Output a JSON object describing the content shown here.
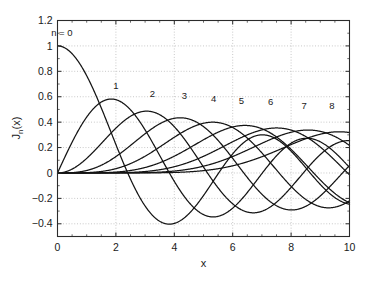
{
  "chart_data": {
    "type": "line",
    "title": "",
    "xlabel": "x",
    "ylabel": "J_n(x)",
    "ylabel_base": "J",
    "ylabel_subscript": "n",
    "ylabel_arg": "(x)",
    "xlim": [
      0,
      10
    ],
    "ylim": [
      -0.5,
      1.2
    ],
    "xticks": [
      0,
      2,
      4,
      6,
      8,
      10
    ],
    "xticklabels": [
      "0",
      "2",
      "4",
      "6",
      "8",
      "10"
    ],
    "yticks": [
      -0.4,
      -0.2,
      0,
      0.2,
      0.4,
      0.6,
      0.8,
      1,
      1.2
    ],
    "yticklabels": [
      "-0.4",
      "-0.2",
      "0",
      "0.2",
      "0.4",
      "0.6",
      "0.8",
      "1",
      "1.2"
    ],
    "grid": true,
    "grid_style": "dotted",
    "legend": "inline-annotations",
    "legend_position": "inline",
    "line_color": "#141414",
    "background_color": "#ffffff",
    "annotations": [
      {
        "text": "n = 0",
        "x": 0.15,
        "y": 1.08
      },
      {
        "text": "1",
        "x": 2.0,
        "y": 0.66
      },
      {
        "text": "2",
        "x": 3.25,
        "y": 0.595
      },
      {
        "text": "3",
        "x": 4.35,
        "y": 0.585
      },
      {
        "text": "4",
        "x": 5.35,
        "y": 0.555
      },
      {
        "text": "5",
        "x": 6.3,
        "y": 0.545
      },
      {
        "text": "6",
        "x": 7.3,
        "y": 0.535
      },
      {
        "text": "7",
        "x": 8.45,
        "y": 0.505
      },
      {
        "text": "8",
        "x": 9.4,
        "y": 0.5
      }
    ],
    "x": [
      0,
      0.2,
      0.4,
      0.6,
      0.8,
      1,
      1.2,
      1.4,
      1.6,
      1.8,
      2,
      2.2,
      2.4,
      2.6,
      2.8,
      3,
      3.2,
      3.4,
      3.6,
      3.8,
      4,
      4.2,
      4.4,
      4.6,
      4.8,
      5,
      5.2,
      5.4,
      5.6,
      5.8,
      6,
      6.2,
      6.4,
      6.6,
      6.8,
      7,
      7.2,
      7.4,
      7.6,
      7.8,
      8,
      8.2,
      8.4,
      8.6,
      8.8,
      9,
      9.2,
      9.4,
      9.6,
      9.8,
      10
    ],
    "series": [
      {
        "name": "J0(x)",
        "n": 0,
        "values": [
          1.0,
          0.99,
          0.9604,
          0.912,
          0.8463,
          0.7652,
          0.6711,
          0.5669,
          0.4554,
          0.34,
          0.2239,
          0.1104,
          0.0025,
          -0.0968,
          -0.185,
          -0.2601,
          -0.3202,
          -0.3643,
          -0.3918,
          -0.4026,
          -0.3971,
          -0.3766,
          -0.3423,
          -0.2961,
          -0.2404,
          -0.1776,
          -0.1103,
          -0.0412,
          0.027,
          0.0917,
          0.1506,
          0.2017,
          0.2433,
          0.274,
          0.2931,
          0.3001,
          0.2951,
          0.2786,
          0.2516,
          0.2154,
          0.1717,
          0.1222,
          0.0692,
          0.0146,
          -0.0392,
          -0.0903,
          -0.1367,
          -0.1768,
          -0.209,
          -0.2323,
          -0.2459
        ]
      },
      {
        "name": "J1(x)",
        "n": 1,
        "values": [
          0.0,
          0.0995,
          0.196,
          0.2867,
          0.3688,
          0.4401,
          0.4983,
          0.5419,
          0.5699,
          0.5815,
          0.5767,
          0.556,
          0.5202,
          0.4708,
          0.4097,
          0.3391,
          0.2613,
          0.1792,
          0.0955,
          0.0128,
          -0.066,
          -0.1386,
          -0.2028,
          -0.2566,
          -0.2985,
          -0.3276,
          -0.3432,
          -0.3453,
          -0.3343,
          -0.311,
          -0.2767,
          -0.2329,
          -0.1816,
          -0.125,
          -0.0652,
          -0.0047,
          0.0543,
          0.1096,
          0.1592,
          0.2014,
          0.2346,
          0.258,
          0.2708,
          0.2728,
          0.2641,
          0.2453,
          0.2174,
          0.1816,
          0.1395,
          0.0928,
          0.0435
        ]
      },
      {
        "name": "J2(x)",
        "n": 2,
        "values": [
          0.0,
          0.005,
          0.0197,
          0.0437,
          0.0758,
          0.1149,
          0.1593,
          0.2074,
          0.257,
          0.3061,
          0.3528,
          0.3951,
          0.431,
          0.459,
          0.4777,
          0.4861,
          0.4835,
          0.4697,
          0.4448,
          0.4093,
          0.3641,
          0.3105,
          0.2501,
          0.1846,
          0.1161,
          0.0466,
          -0.0217,
          -0.0867,
          -0.1464,
          -0.199,
          -0.2429,
          -0.2769,
          -0.3001,
          -0.3119,
          -0.3123,
          -0.3014,
          -0.28,
          -0.249,
          -0.2097,
          -0.1638,
          -0.113,
          -0.0594,
          -0.005,
          0.0483,
          0.0988,
          0.1448,
          0.1846,
          0.217,
          0.2409,
          0.2556,
          0.2546
        ]
      },
      {
        "name": "J3(x)",
        "n": 3,
        "values": [
          0.0,
          0.0002,
          0.0013,
          0.0044,
          0.0102,
          0.0196,
          0.0329,
          0.0505,
          0.0725,
          0.0988,
          0.1289,
          0.1623,
          0.1981,
          0.2353,
          0.2727,
          0.3091,
          0.3431,
          0.3734,
          0.3988,
          0.418,
          0.4302,
          0.4344,
          0.4301,
          0.4171,
          0.3952,
          0.3648,
          0.3265,
          0.2812,
          0.2301,
          0.1746,
          0.1148,
          0.0562,
          -0.0018,
          -0.0568,
          -0.1064,
          -0.1676,
          -0.1988,
          -0.2262,
          -0.245,
          -0.2551,
          -0.2911,
          -0.2559,
          -0.2437,
          -0.2222,
          -0.193,
          -0.1809,
          -0.1327,
          -0.0913,
          -0.0478,
          -0.0035,
          0.0584
        ]
      },
      {
        "name": "J4(x)",
        "n": 4,
        "values": [
          0.0,
          0.0,
          0.0,
          0.0002,
          0.0006,
          0.0025,
          0.005,
          0.0091,
          0.015,
          0.0232,
          0.034,
          0.0476,
          0.0643,
          0.0838,
          0.1061,
          0.132,
          0.1591,
          0.1876,
          0.2166,
          0.2449,
          0.2811,
          0.2966,
          0.3169,
          0.332,
          0.3412,
          0.3912,
          0.3412,
          0.332,
          0.3169,
          0.2966,
          0.3576,
          0.2427,
          0.211,
          0.1762,
          0.1393,
          0.1578,
          0.0621,
          0.0242,
          -0.0126,
          -0.0476,
          -0.1054,
          -0.1095,
          -0.1346,
          -0.1555,
          -0.1715,
          -0.1869,
          -0.1864,
          -0.1842,
          -0.1727,
          -0.155,
          -0.122
        ]
      },
      {
        "name": "J5(x)",
        "n": 5,
        "values": [
          0.0,
          0.0,
          0.0,
          0.0,
          0.0001,
          0.0002,
          0.0006,
          0.0013,
          0.0025,
          0.0044,
          0.007,
          0.0112,
          0.0166,
          0.0237,
          0.0326,
          0.043,
          0.0568,
          0.0715,
          0.088,
          0.1061,
          0.1321,
          0.146,
          0.1662,
          0.1862,
          0.2057,
          0.2611,
          0.2403,
          0.2551,
          0.2683,
          0.2785,
          0.3621,
          0.2878,
          0.2878,
          0.2841,
          0.2766,
          0.3479,
          0.2491,
          0.2291,
          0.2057,
          0.1793,
          0.1858,
          0.119,
          0.0862,
          0.0525,
          0.0184,
          -0.055,
          -0.0478,
          -0.0797,
          -0.1093,
          -0.1359,
          -0.2341
        ]
      },
      {
        "name": "J6(x)",
        "n": 6,
        "values": [
          0.0,
          0.0,
          0.0,
          0.0,
          0.0,
          0.0,
          0.0001,
          0.0002,
          0.0004,
          0.0008,
          0.0012,
          0.0021,
          0.0034,
          0.0052,
          0.0078,
          0.0114,
          0.0157,
          0.0212,
          0.0282,
          0.0366,
          0.0491,
          0.0571,
          0.0699,
          0.084,
          0.0994,
          0.131,
          0.133,
          0.1506,
          0.1685,
          0.1863,
          0.2458,
          0.2206,
          0.2364,
          0.2507,
          0.2632,
          0.3392,
          0.281,
          0.2861,
          0.2879,
          0.2866,
          0.3376,
          0.2747,
          0.2642,
          0.2505,
          0.2339,
          0.2043,
          0.1931,
          0.1699,
          0.1448,
          0.1182,
          0.0337
        ]
      },
      {
        "name": "J7(x)",
        "n": 7,
        "values": [
          0.0,
          0.0,
          0.0,
          0.0,
          0.0,
          0.0,
          0.0,
          0.0,
          0.0001,
          0.0001,
          0.0002,
          0.0004,
          0.0006,
          0.001,
          0.0016,
          0.0025,
          0.0037,
          0.0054,
          0.0076,
          0.0105,
          0.0152,
          0.0187,
          0.0244,
          0.0311,
          0.039,
          0.0534,
          0.0584,
          0.07,
          0.0827,
          0.0965,
          0.1296,
          0.1268,
          0.1428,
          0.1592,
          0.1757,
          0.2336,
          0.2077,
          0.2228,
          0.2368,
          0.2494,
          0.3206,
          0.2692,
          0.2759,
          0.2802,
          0.2819,
          0.2546,
          0.278,
          0.2724,
          0.2641,
          0.2531,
          0.2167
        ]
      },
      {
        "name": "J8(x)",
        "n": 8,
        "values": [
          0.0,
          0.0,
          0.0,
          0.0,
          0.0,
          0.0,
          0.0,
          0.0,
          0.0,
          0.0,
          0.0,
          0.0001,
          0.0001,
          0.0002,
          0.0003,
          0.0005,
          0.0008,
          0.0012,
          0.0018,
          0.0026,
          0.004,
          0.0052,
          0.0071,
          0.0095,
          0.0124,
          0.0184,
          0.0204,
          0.0255,
          0.0314,
          0.0382,
          0.0565,
          0.0545,
          0.0641,
          0.0745,
          0.0856,
          0.1263,
          0.1095,
          0.1222,
          0.1351,
          0.1481,
          0.2235,
          0.1735,
          0.1855,
          0.1967,
          0.207,
          0.2043,
          0.2239,
          0.2302,
          0.2348,
          0.2377,
          0.3179
        ]
      }
    ]
  }
}
